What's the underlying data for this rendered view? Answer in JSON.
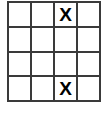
{
  "puzzle": {
    "type": "grid",
    "rows": 4,
    "columns": 4,
    "mark_symbol": "X",
    "empty_symbol": "",
    "colors": {
      "grid_line": "#3a3a3a",
      "cell_background": "#ffffff",
      "mark_color": "#000000",
      "page_background": "#ffffff"
    },
    "cells": [
      [
        {
          "row": 1,
          "col": 1,
          "value": ""
        },
        {
          "row": 1,
          "col": 2,
          "value": ""
        },
        {
          "row": 1,
          "col": 3,
          "value": "X"
        },
        {
          "row": 1,
          "col": 4,
          "value": ""
        }
      ],
      [
        {
          "row": 2,
          "col": 1,
          "value": ""
        },
        {
          "row": 2,
          "col": 2,
          "value": ""
        },
        {
          "row": 2,
          "col": 3,
          "value": ""
        },
        {
          "row": 2,
          "col": 4,
          "value": ""
        }
      ],
      [
        {
          "row": 3,
          "col": 1,
          "value": ""
        },
        {
          "row": 3,
          "col": 2,
          "value": ""
        },
        {
          "row": 3,
          "col": 3,
          "value": ""
        },
        {
          "row": 3,
          "col": 4,
          "value": ""
        }
      ],
      [
        {
          "row": 4,
          "col": 1,
          "value": ""
        },
        {
          "row": 4,
          "col": 2,
          "value": ""
        },
        {
          "row": 4,
          "col": 3,
          "value": "X"
        },
        {
          "row": 4,
          "col": 4,
          "value": ""
        }
      ]
    ]
  }
}
